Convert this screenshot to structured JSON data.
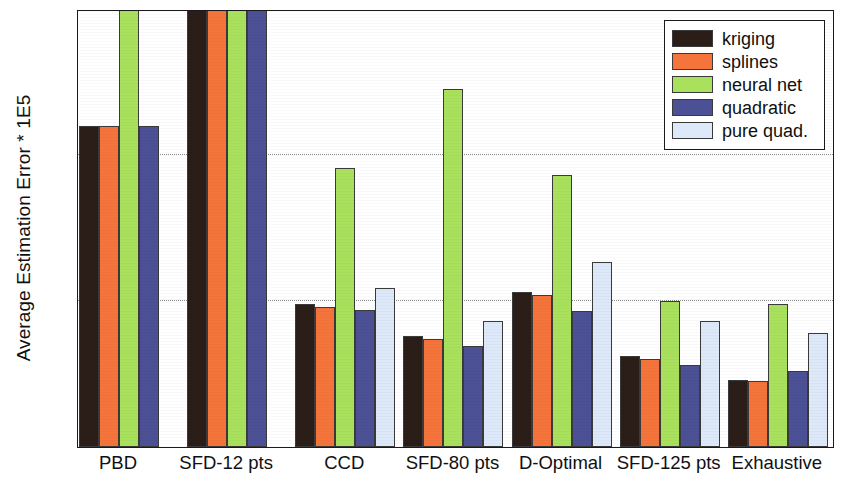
{
  "chart_data": {
    "type": "bar",
    "title": "",
    "xlabel": "",
    "ylabel": "Average Estimation Error * 1E5",
    "ylim": [
      0,
      1.5
    ],
    "yticks": [
      0,
      0.5,
      1,
      1.5
    ],
    "ytick_labels": [
      "0",
      "0.5",
      "1",
      "1.5"
    ],
    "grid": true,
    "grid_axis": "y",
    "legend_position": "top-right",
    "categories": [
      "PBD",
      "SFD-12 pts",
      "CCD",
      "SFD-80 pts",
      "D-Optimal",
      "SFD-125 pts",
      "Exhaustive"
    ],
    "series": [
      {
        "name": "kriging",
        "color": "#2b1d17",
        "values": [
          1.1,
          1.5,
          0.49,
          0.38,
          0.53,
          0.31,
          0.23
        ],
        "clipped": [
          false,
          true,
          false,
          false,
          false,
          false,
          false
        ]
      },
      {
        "name": "splines",
        "color": "#f4743c",
        "values": [
          1.1,
          1.5,
          0.48,
          0.37,
          0.52,
          0.3,
          0.225
        ],
        "clipped": [
          false,
          true,
          false,
          false,
          false,
          false,
          false
        ]
      },
      {
        "name": "neural net",
        "color": "#a9e15c",
        "values": [
          1.5,
          1.5,
          0.955,
          1.225,
          0.93,
          0.5,
          0.49
        ],
        "clipped": [
          true,
          true,
          false,
          false,
          false,
          false,
          false
        ]
      },
      {
        "name": "quadratic",
        "color": "#4c5196",
        "values": [
          1.1,
          1.5,
          0.47,
          0.345,
          0.465,
          0.28,
          0.26
        ],
        "clipped": [
          false,
          true,
          false,
          false,
          false,
          false,
          false
        ]
      },
      {
        "name": "pure quad.",
        "color": "#dde8f8",
        "values": [
          null,
          null,
          0.545,
          0.43,
          0.635,
          0.43,
          0.39
        ],
        "clipped": [
          false,
          false,
          false,
          false,
          false,
          false,
          false
        ]
      }
    ]
  },
  "legend": {
    "items": [
      {
        "label": "kriging",
        "color": "#2b1d17"
      },
      {
        "label": "splines",
        "color": "#f4743c"
      },
      {
        "label": "neural net",
        "color": "#a9e15c"
      },
      {
        "label": "quadratic",
        "color": "#4c5196"
      },
      {
        "label": "pure quad.",
        "color": "#dde8f8"
      }
    ]
  }
}
